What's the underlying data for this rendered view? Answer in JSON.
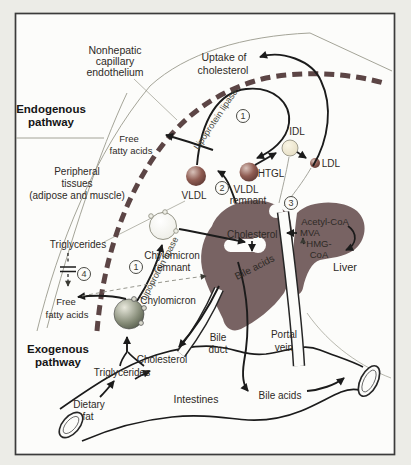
{
  "pathways": {
    "endogenous": [
      "Endogenous",
      "pathway"
    ],
    "exogenous": [
      "Exogenous",
      "pathway"
    ]
  },
  "anatomy": {
    "nonhepatic": [
      "Nonhepatic",
      "capillary",
      "endothelium"
    ],
    "peripheral": [
      "Peripheral",
      "tissues",
      "(adipose and muscle)"
    ],
    "liver": "Liver",
    "bile_duct": [
      "Bile",
      "duct"
    ],
    "portal_vein": [
      "Portal",
      "vein"
    ],
    "intestines": "Intestines",
    "dietary_fat": [
      "Dietary",
      "fat"
    ]
  },
  "lipoproteins": {
    "vldl": "VLDL",
    "vldl_remnant": [
      "VLDL",
      "remnant"
    ],
    "idl": "IDL",
    "ldl": "LDL",
    "chylomicron": "Chylomicron",
    "chylomicron_remnant": [
      "Chylomicron",
      "remnant"
    ]
  },
  "molecules": {
    "uptake_of_cholesterol": [
      "Uptake of",
      "cholesterol"
    ],
    "free_fatty_acids_top": [
      "Free",
      "fatty acids"
    ],
    "free_fatty_acids_bottom": [
      "Free",
      "fatty acids"
    ],
    "triglycerides_tissue": "Triglycerides",
    "triglycerides_intestine": "Triglycerides",
    "cholesterol_intestine": "Cholesterol",
    "cholesterol_liver": "Cholesterol",
    "bile_acids_liver": "Bile acids",
    "bile_acids_intestine": "Bile acids",
    "acetyl_coa": "Acetyl-CoA",
    "mva": "MVA",
    "hmg_coa": [
      "HMG-",
      "CoA"
    ]
  },
  "enzymes": {
    "lipoprotein_lipase_top": "Lipoprotein lipase",
    "lipoprotein_lipase_bottom": "Lipoprotein lipase",
    "htgl": "HTGL"
  },
  "steps": [
    "1",
    "2",
    "3",
    "4"
  ],
  "colors": {
    "liver": "#786363",
    "capillary_dash": "#5c4545",
    "htgl_text": "#7a2e2e",
    "line": "#1b1b1b"
  }
}
